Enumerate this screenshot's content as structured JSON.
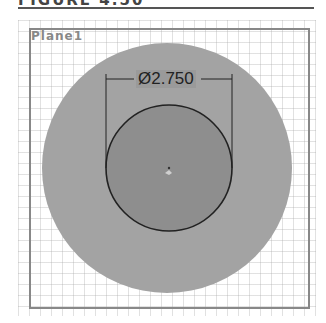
{
  "heading": {
    "text": "FIGURE 4.50"
  },
  "sketch": {
    "plane_label": "Plane1",
    "dimension": {
      "symbol": "Ø",
      "value": "2.750",
      "label": "Ø2.750"
    },
    "colors": {
      "background": "#ffffff",
      "grid": "#c8c8c8",
      "frame": "#888888",
      "outer_circle": "#a3a3a3",
      "inner_circle": "#8e8e8e",
      "circle_outline": "#222222",
      "dimension_line": "#222222"
    }
  }
}
